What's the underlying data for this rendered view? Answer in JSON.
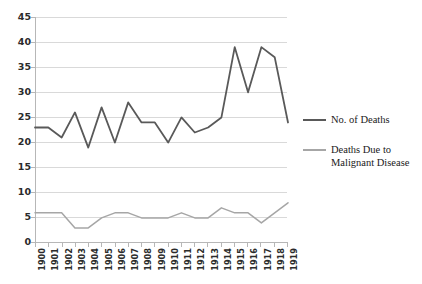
{
  "chart_data": {
    "type": "line",
    "title": "",
    "xlabel": "",
    "ylabel": "",
    "ylim": [
      0,
      45
    ],
    "ytick_step": 5,
    "grid": true,
    "legend_position": "right",
    "categories": [
      "1900",
      "1901",
      "1902",
      "1903",
      "1904",
      "1905",
      "1906",
      "1907",
      "1908",
      "1909",
      "1910",
      "1911",
      "1912",
      "1913",
      "1914",
      "1915",
      "1916",
      "1917",
      "1918",
      "1919"
    ],
    "yticks": [
      "0",
      "5",
      "10",
      "15",
      "20",
      "25",
      "30",
      "35",
      "40",
      "45"
    ],
    "series": [
      {
        "name": "No. of Deaths",
        "color": "#595959",
        "values": [
          23,
          23,
          21,
          26,
          19,
          27,
          20,
          28,
          24,
          24,
          20,
          25,
          22,
          23,
          25,
          39,
          30,
          39,
          37,
          24
        ]
      },
      {
        "name": "Deaths Due to Malignant Disease",
        "color": "#a6a6a6",
        "values": [
          6,
          6,
          6,
          3,
          3,
          5,
          6,
          6,
          5,
          5,
          5,
          6,
          5,
          5,
          7,
          6,
          6,
          4,
          6,
          8
        ]
      }
    ],
    "legend": [
      {
        "label": "No. of Deaths",
        "color": "#595959"
      },
      {
        "label": "Deaths Due to Malignant Disease",
        "color": "#a6a6a6"
      }
    ]
  },
  "colors": {
    "series_primary": "#595959",
    "series_secondary": "#a6a6a6",
    "gridline": "#d9d9d9",
    "axis": "#b7b7b7",
    "text": "#2b2b2b",
    "background": "#ffffff"
  }
}
